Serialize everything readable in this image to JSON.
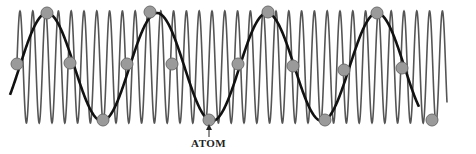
{
  "figure": {
    "label_text": "ATOM",
    "label_position": {
      "x": 209,
      "y": 141
    },
    "arrow": {
      "x": 209,
      "y_from": 137,
      "y_to": 124
    },
    "colors": {
      "fast_wave": "#555555",
      "slow_wave": "#111111",
      "sample_fill": "#9a9a9a",
      "sample_stroke": "#6e6e6e",
      "background": "#ffffff"
    },
    "fast_wave": {
      "x_start": 17,
      "x_end": 447,
      "center_y": 67,
      "amplitude": 56,
      "period": 12.8,
      "phase_x": 20
    },
    "slow_wave": {
      "x_start": 10,
      "x_end": 419,
      "center_y": 67,
      "amplitude": 54,
      "period": 110,
      "phase_x": 47
    },
    "samples": [
      {
        "x": 17,
        "y": 64
      },
      {
        "x": 47,
        "y": 13
      },
      {
        "x": 70,
        "y": 63
      },
      {
        "x": 103,
        "y": 120
      },
      {
        "x": 127,
        "y": 64
      },
      {
        "x": 150,
        "y": 12
      },
      {
        "x": 172,
        "y": 64
      },
      {
        "x": 209,
        "y": 120
      },
      {
        "x": 238,
        "y": 64
      },
      {
        "x": 268,
        "y": 12
      },
      {
        "x": 293,
        "y": 66
      },
      {
        "x": 325,
        "y": 120
      },
      {
        "x": 344,
        "y": 70
      },
      {
        "x": 377,
        "y": 13
      },
      {
        "x": 402,
        "y": 68
      },
      {
        "x": 432,
        "y": 120
      }
    ]
  }
}
